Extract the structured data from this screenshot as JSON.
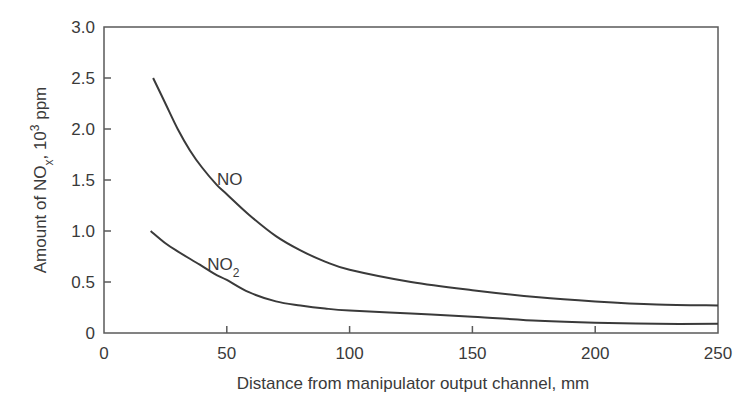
{
  "chart_data": {
    "type": "line",
    "title": "",
    "xlabel": "Distance from manipulator output channel, mm",
    "ylabel": "Amount of NOx, 10^3 ppm",
    "ylabel_parts": {
      "pre": "Amount of NO",
      "sub": "x",
      "mid": ", 10",
      "sup": "3",
      "post": " ppm"
    },
    "xlim": [
      0,
      250
    ],
    "ylim": [
      0,
      3.0
    ],
    "xticks": [
      0,
      50,
      100,
      150,
      200,
      250
    ],
    "xtick_labels": [
      "0",
      "50",
      "100",
      "150",
      "200",
      "250"
    ],
    "yticks": [
      0,
      0.5,
      1.0,
      1.5,
      2.0,
      2.5,
      3.0
    ],
    "ytick_labels": [
      "0",
      "0.5",
      "1.0",
      "1.5",
      "2.0",
      "2.5",
      "3.0"
    ],
    "grid": false,
    "legend": "inline labels",
    "series": [
      {
        "name": "NO",
        "label": "NO",
        "label_pos": {
          "x": 46,
          "y": 1.45
        },
        "x": [
          20,
          25,
          30,
          35,
          40,
          46,
          50,
          59,
          70,
          80,
          90,
          100,
          125,
          150,
          177,
          200,
          225,
          250
        ],
        "values": [
          2.5,
          2.25,
          2.0,
          1.79,
          1.62,
          1.45,
          1.36,
          1.16,
          0.95,
          0.81,
          0.7,
          0.62,
          0.5,
          0.42,
          0.35,
          0.31,
          0.28,
          0.27
        ]
      },
      {
        "name": "NO2",
        "label": "NO",
        "label_sub": "2",
        "label_pos": {
          "x": 42,
          "y": 0.62
        },
        "x": [
          19,
          25,
          30,
          39,
          45,
          50,
          59,
          70,
          80,
          90,
          100,
          125,
          150,
          177,
          200,
          225,
          250
        ],
        "values": [
          1.0,
          0.88,
          0.8,
          0.67,
          0.58,
          0.52,
          0.4,
          0.31,
          0.27,
          0.24,
          0.22,
          0.19,
          0.16,
          0.12,
          0.1,
          0.09,
          0.09
        ]
      }
    ]
  },
  "colors": {
    "line": "#3a3a3a",
    "axis": "#5a5a5a",
    "text": "#3a3a3a",
    "background": "#ffffff"
  }
}
